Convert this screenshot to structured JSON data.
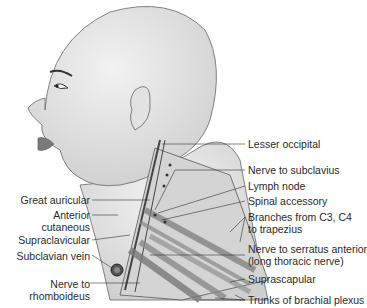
{
  "diagram": {
    "colors": {
      "skin": "#e6e6e6",
      "outline": "#555555",
      "label": "#2a2a2a",
      "muscle": "#9a9a9a",
      "lip": "#7a7a7a"
    },
    "labels_right": [
      {
        "text": "Lesser occipital"
      },
      {
        "text": "Nerve to subclavius"
      },
      {
        "text": "Lymph node"
      },
      {
        "text": "Spinal accessory"
      },
      {
        "line1": "Branches from C3, C4",
        "line2": "to trapezius"
      },
      {
        "line1": "Nerve to serratus anterior",
        "line2": "(long thoracic nerve)"
      },
      {
        "text": "Suprascapular"
      },
      {
        "text": "Trunks of brachial plexus"
      }
    ],
    "labels_left": [
      {
        "text": "Great auricular"
      },
      {
        "line1": "Anterior",
        "line2": "cutaneous"
      },
      {
        "text": "Supraclavicular"
      },
      {
        "text": "Subclavian vein"
      },
      {
        "line1": "Nerve to",
        "line2": "rhomboideus"
      }
    ]
  }
}
